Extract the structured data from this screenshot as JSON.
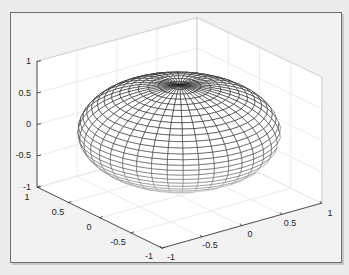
{
  "chart_data": {
    "type": "surface",
    "title": "",
    "surface": {
      "shape": "oblate ellipsoid",
      "x_radius": 1,
      "y_radius": 1,
      "z_radius": 0.75,
      "center": [
        0,
        0,
        0
      ],
      "mesh_color_top": "#1a1a1a",
      "mesh_color_bottom": "#e0e0e0",
      "face_color": "#ffffff"
    },
    "axes": {
      "x": {
        "label": "",
        "range": [
          -1,
          1
        ],
        "ticks": [
          "-1",
          "-0.5",
          "0",
          "0.5",
          "1"
        ]
      },
      "y": {
        "label": "",
        "range": [
          -1,
          1
        ],
        "ticks": [
          "1",
          "0.5",
          "0",
          "-0.5",
          "-1"
        ]
      },
      "z": {
        "label": "",
        "range": [
          -1,
          1
        ],
        "ticks": [
          "-1",
          "-0.5",
          "0",
          "0.5",
          "1"
        ]
      },
      "grid": true,
      "box": "3D"
    },
    "colors": {
      "background": "#f2f2f2",
      "axes_face": "#ffffff",
      "grid": "#e6e6e6",
      "axis_line": "#262626"
    }
  },
  "labels": {
    "z_ticks": [
      "1",
      "0.5",
      "0",
      "-0.5",
      "-1"
    ],
    "y_ticks": [
      "1",
      "0.5",
      "0",
      "-0.5",
      "-1"
    ],
    "x_ticks": [
      "-1",
      "-0.5",
      "0",
      "0.5",
      "1"
    ]
  }
}
